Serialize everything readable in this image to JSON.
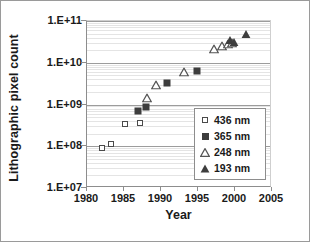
{
  "chart_data": {
    "type": "scatter",
    "title": "",
    "xlabel": "Year",
    "ylabel": "Lithographic pixel count",
    "xlim": [
      1980,
      2005
    ],
    "ylim": [
      10000000.0,
      100000000000.0
    ],
    "yscale": "log",
    "grid": true,
    "legend_position": "inside-right",
    "xticks": [
      "1980",
      "1985",
      "1990",
      "1995",
      "2000",
      "2005"
    ],
    "xtick_values": [
      1980,
      1985,
      1990,
      1995,
      2000,
      2005
    ],
    "yticks": [
      "1.E+07",
      "1.E+08",
      "1.E+09",
      "1.E+10",
      "1.E+11"
    ],
    "ytick_values": [
      10000000,
      100000000,
      1000000000,
      10000000000,
      100000000000
    ],
    "series": [
      {
        "name": "436 nm",
        "marker": "open-square",
        "color": "#4a4a4a",
        "points": [
          {
            "x": 1982.0,
            "y": 90000000.0
          },
          {
            "x": 1983.2,
            "y": 115000000.0
          },
          {
            "x": 1985.2,
            "y": 340000000.0
          },
          {
            "x": 1987.1,
            "y": 370000000.0
          }
        ]
      },
      {
        "name": "365 nm",
        "marker": "filled-square",
        "color": "#3d3d3d",
        "points": [
          {
            "x": 1986.9,
            "y": 700000000.0
          },
          {
            "x": 1988.0,
            "y": 860000000.0
          },
          {
            "x": 1990.8,
            "y": 3300000000.0
          },
          {
            "x": 1994.9,
            "y": 6500000000.0
          }
        ]
      },
      {
        "name": "248 nm",
        "marker": "open-triangle",
        "color": "#555555",
        "points": [
          {
            "x": 1988.1,
            "y": 1400000000.0
          },
          {
            "x": 1989.3,
            "y": 2900000000.0
          },
          {
            "x": 1993.1,
            "y": 6100000000.0
          },
          {
            "x": 1997.2,
            "y": 21000000000.0
          },
          {
            "x": 1998.3,
            "y": 25000000000.0
          },
          {
            "x": 1999.0,
            "y": 28000000000.0
          },
          {
            "x": 1999.6,
            "y": 29000000000.0
          }
        ]
      },
      {
        "name": "193 nm",
        "marker": "filled-triangle",
        "color": "#3d3d3d",
        "points": [
          {
            "x": 1999.3,
            "y": 35000000000.0
          },
          {
            "x": 1999.8,
            "y": 32000000000.0
          },
          {
            "x": 2001.5,
            "y": 50000000000.0
          }
        ]
      }
    ]
  },
  "axis": {
    "ylabel": "Lithographic pixel count",
    "xlabel": "Year"
  },
  "legend": {
    "items": [
      {
        "label": "436 nm",
        "marker": "open-square"
      },
      {
        "label": "365 nm",
        "marker": "filled-square"
      },
      {
        "label": "248 nm",
        "marker": "open-triangle"
      },
      {
        "label": "193 nm",
        "marker": "filled-triangle"
      }
    ]
  }
}
